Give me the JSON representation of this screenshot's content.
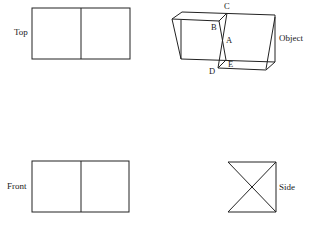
{
  "diagram": {
    "type": "orthographic-projection",
    "stroke_color": "#222222",
    "views": {
      "top": {
        "label": "Top"
      },
      "front": {
        "label": "Front"
      },
      "side": {
        "label": "Side"
      },
      "object": {
        "label": "Object"
      }
    },
    "points": {
      "A": "A",
      "B": "B",
      "C": "C",
      "D": "D",
      "E": "E"
    }
  }
}
